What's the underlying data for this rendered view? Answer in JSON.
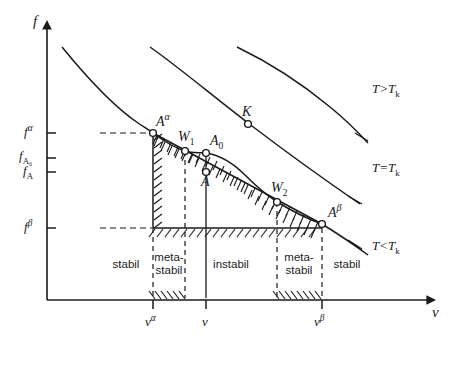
{
  "figure": {
    "ink_color": "#1a1a1a",
    "background_color": "#ffffff"
  },
  "axes": {
    "y_axis_label": "f",
    "x_axis_label": "v",
    "y_ticks": [
      {
        "id": "f_alpha",
        "base": "f",
        "sup": "α",
        "sub": "",
        "y": 133
      },
      {
        "id": "f_A0",
        "base": "f",
        "sup": "",
        "sub": "A₀",
        "y": 158
      },
      {
        "id": "f_A",
        "base": "f",
        "sup": "",
        "sub": "A",
        "y": 172
      },
      {
        "id": "f_beta",
        "base": "f",
        "sup": "β",
        "sub": "",
        "y": 228
      }
    ],
    "x_ticks": [
      {
        "id": "v_alpha",
        "base": "v",
        "sup": "α",
        "x": 153
      },
      {
        "id": "v",
        "base": "v",
        "sup": "",
        "x": 206
      },
      {
        "id": "v_beta",
        "base": "v",
        "sup": "β",
        "x": 322
      }
    ]
  },
  "curves": [
    {
      "id": "isotherm-above-critical",
      "label": "T>T",
      "label_sub": "k",
      "label_x": 372,
      "label_y": 88,
      "path": "M 237,47 C 268,62 300,82 330,107 C 345,119 356,130 368,143"
    },
    {
      "id": "isotherm-critical",
      "label": "T=T",
      "label_sub": "k",
      "label_x": 372,
      "label_y": 167,
      "path": "M 150,47 C 180,68 215,98 252,126 C 290,155 325,180 360,204"
    },
    {
      "id": "isotherm-below-critical",
      "label": "T<T",
      "label_sub": "k",
      "label_x": 372,
      "label_y": 245,
      "path": "M 62,47 C 84,74 110,104 138,123 C 144,127 149,130 153,133"
    }
  ],
  "points": [
    {
      "id": "A_alpha",
      "base": "A",
      "sup": "α",
      "x": 153,
      "y": 133,
      "label_x": 156,
      "label_y": 112
    },
    {
      "id": "W_1",
      "base": "W",
      "sub": "1",
      "x": 185,
      "y": 151,
      "label_x": 178,
      "label_y": 130
    },
    {
      "id": "A_0",
      "base": "A",
      "sub": "0",
      "x": 206,
      "y": 153,
      "label_x": 210,
      "label_y": 134
    },
    {
      "id": "A",
      "base": "A",
      "sub": "",
      "x": 206,
      "y": 172,
      "label_x": 201,
      "label_y": 175
    },
    {
      "id": "W_2",
      "base": "W",
      "sub": "2",
      "x": 277,
      "y": 202,
      "label_x": 271,
      "label_y": 181
    },
    {
      "id": "A_beta",
      "base": "A",
      "sup": "β",
      "x": 322,
      "y": 224,
      "label_x": 328,
      "label_y": 203
    },
    {
      "id": "K",
      "base": "K",
      "sub": "",
      "x": 248,
      "y": 124,
      "label_x": 242,
      "label_y": 105
    }
  ],
  "regions": [
    {
      "id": "region-stabil-left",
      "text": "stabil",
      "center_x": 126,
      "top": 251
    },
    {
      "id": "region-metastabil-left",
      "text": "meta-\nstabil",
      "center_x": 169,
      "top": 251
    },
    {
      "id": "region-instabil",
      "text": "instabil",
      "center_x": 231,
      "top": 258
    },
    {
      "id": "region-metastabil-right",
      "text": "meta-\nstabil",
      "center_x": 299,
      "top": 251
    },
    {
      "id": "region-stabil-right",
      "text": "stabil",
      "center_x": 345,
      "top": 258
    }
  ],
  "boundaries": {
    "dashed_vertical_x": [
      153,
      185,
      277,
      322
    ],
    "solid_vertical_x": [
      206
    ],
    "dashed_horizontal": [
      {
        "id": "f-alpha-guide",
        "y": 133,
        "x1": 100,
        "x2": 153
      },
      {
        "id": "f-beta-guide",
        "y": 228,
        "x1": 100,
        "x2": 153
      }
    ]
  },
  "s_curve": {
    "id": "spinodal-s-curve",
    "path": "M 153,133 C 165,142 175,148 185,151 C 194,154 201,152 206,153 C 219,155 232,162 245,175 C 258,188 268,196 277,202 C 292,211 308,219 322,224"
  },
  "tie_line": {
    "id": "common-tangent",
    "x1": 153,
    "y1": 133,
    "x2": 322,
    "y2": 224
  }
}
